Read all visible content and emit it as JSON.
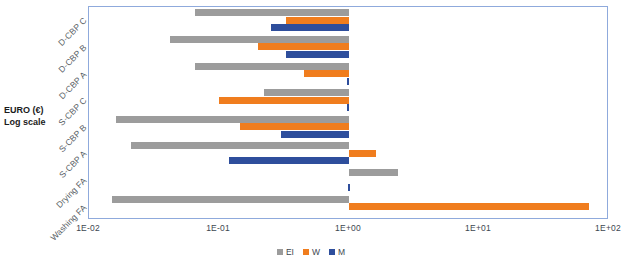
{
  "chart": {
    "type": "bar",
    "title": "",
    "axis_title_lines": [
      "EURO (€)",
      "Log scale"
    ],
    "legend_position": "bottom"
  },
  "chart_data": {
    "type": "bar",
    "orientation": "horizontal",
    "title": "",
    "xlabel": "",
    "ylabel": "EURO (€) Log scale",
    "x_scale": "log",
    "xlim": [
      0.01,
      100
    ],
    "xticks": [
      0.01,
      0.1,
      1,
      10,
      100
    ],
    "xtick_labels": [
      "1E-02",
      "1E-01",
      "1E+00",
      "1E+01",
      "1E+02"
    ],
    "grid": false,
    "baseline": 1.0,
    "note": "Bars are drawn between the category value and the 1E+00 baseline on a log axis.",
    "categories": [
      "D-CBP C",
      "D-CBP B",
      "D-CBP A",
      "S-CBP C",
      "S-CBP B",
      "S-CBP A",
      "Drying FA",
      "Washing FA"
    ],
    "series": [
      {
        "name": "EI",
        "color": "#9C9C9C",
        "values": [
          0.065,
          0.042,
          0.065,
          0.22,
          0.016,
          0.021,
          2.4,
          0.015
        ]
      },
      {
        "name": "W",
        "color": "#F07D1E",
        "values": [
          0.33,
          0.2,
          0.45,
          0.1,
          0.145,
          1.6,
          null,
          70.0
        ]
      },
      {
        "name": "M",
        "color": "#2E4E9C",
        "values": [
          0.25,
          0.33,
          0.96,
          0.97,
          0.3,
          0.12,
          0.99,
          null
        ]
      }
    ],
    "legend": [
      "EI",
      "W",
      "M"
    ]
  },
  "colors": {
    "ei": "#9C9C9C",
    "w": "#F07D1E",
    "m": "#2E4E9C",
    "frame": "#8FAADC",
    "text": "#3c4650"
  }
}
